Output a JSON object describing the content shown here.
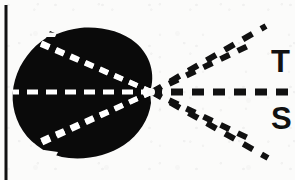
{
  "figure": {
    "kind": "scanned-line-diagram",
    "width": 295,
    "height": 180,
    "background_color": "#fbfbfa",
    "ink_color": "#0a0a0a",
    "highlight_color": "#ffffff",
    "border": {
      "name": "left-rule",
      "x": 5,
      "y_top": 6,
      "y_bottom": 180,
      "thickness": 3,
      "color": "#111111"
    },
    "specimen": {
      "name": "specimen-silhouette",
      "description": "solid black rounded irregular blob occupying the left portion",
      "fill": "#0a0a0a",
      "bounds": {
        "x": 13,
        "y": 29,
        "width": 143,
        "height": 130
      },
      "notches": [
        {
          "name": "upper-left-notch",
          "x": 45,
          "y": 33
        },
        {
          "name": "lower-left-notch",
          "x": 50,
          "y": 150
        }
      ]
    },
    "convergence_point": {
      "name": "convergence-point",
      "x": 152,
      "y": 92
    },
    "rays": [
      {
        "id": "ray-upper-outer",
        "angle_deg": -37,
        "inner_end_x": 32,
        "inner_end_y": 41,
        "outer_end_x": 262,
        "outer_end_y": 27
      },
      {
        "id": "ray-upper-inner",
        "angle_deg": -21,
        "inner_end_x": 46,
        "inner_end_y": 48,
        "outer_end_x": 247,
        "outer_end_y": 47
      },
      {
        "id": "ray-axis",
        "angle_deg": 0,
        "inner_end_x": 14,
        "inner_end_y": 92,
        "outer_end_x": 295,
        "outer_end_y": 92
      },
      {
        "id": "ray-lower-inner",
        "angle_deg": 21,
        "inner_end_x": 46,
        "inner_end_y": 137,
        "outer_end_x": 247,
        "outer_end_y": 137
      },
      {
        "id": "ray-lower-outer",
        "angle_deg": 37,
        "inner_end_x": 33,
        "inner_end_y": 146,
        "outer_end_x": 265,
        "outer_end_y": 157
      }
    ],
    "dash_style": {
      "inside_specimen": {
        "color": "#ffffff",
        "dash": "9 7",
        "width": 5
      },
      "outside_specimen": {
        "color": "#111111",
        "dash": "11 9",
        "width": 6
      }
    },
    "labels": [
      {
        "id": "label-t",
        "text": "T",
        "x": 271,
        "y": 46,
        "clipped_at_right_edge": true
      },
      {
        "id": "label-s",
        "text": "S",
        "x": 271,
        "y": 103,
        "clipped_at_right_edge": true
      }
    ]
  }
}
